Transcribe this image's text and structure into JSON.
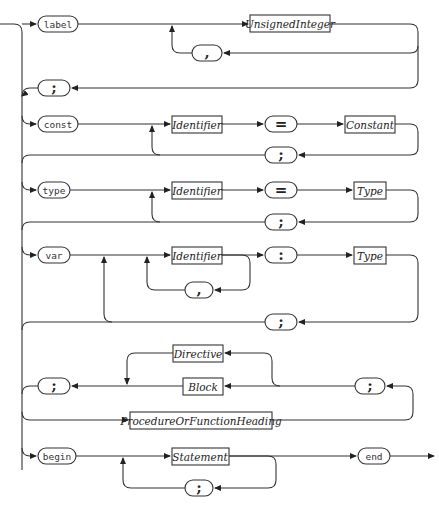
{
  "diagram": {
    "type": "syntax-diagram",
    "subject": "Block",
    "keywords": {
      "label": "label",
      "const": "const",
      "type": "type",
      "var": "var",
      "begin": "begin",
      "end": "end"
    },
    "symbols": {
      "comma": ",",
      "semicolon": ";",
      "equals": "=",
      "colon": ":"
    },
    "nonterminals": {
      "unsigned_integer": "UnsignedInteger",
      "identifier": "Identifier",
      "constant": "Constant",
      "type": "Type",
      "directive": "Directive",
      "block": "Block",
      "proc_func_heading": "ProcedureOrFunctionHeading",
      "statement": "Statement"
    },
    "sections": [
      {
        "name": "label-declaration",
        "sequence": [
          "label",
          "UnsignedInteger",
          "{, UnsignedInteger}",
          ";"
        ]
      },
      {
        "name": "constant-definition",
        "sequence": [
          "const",
          "Identifier",
          "=",
          "Constant",
          ";",
          "{repeat}"
        ]
      },
      {
        "name": "type-definition",
        "sequence": [
          "type",
          "Identifier",
          "=",
          "Type",
          ";",
          "{repeat}"
        ]
      },
      {
        "name": "variable-declaration",
        "sequence": [
          "var",
          "Identifier",
          "{, Identifier}",
          ":",
          "Type",
          ";",
          "{repeat}"
        ]
      },
      {
        "name": "procedure-function-declaration",
        "sequence": [
          "ProcedureOrFunctionHeading",
          ";",
          "Block | Directive",
          ";"
        ]
      },
      {
        "name": "statement-part",
        "sequence": [
          "begin",
          "Statement",
          "{; Statement}",
          "end"
        ]
      }
    ]
  }
}
